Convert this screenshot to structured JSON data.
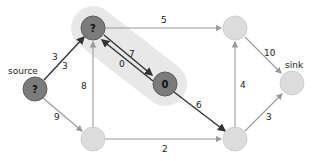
{
  "diagram": {
    "type": "flow-network",
    "colors": {
      "visited_node": "#7b7b7b",
      "unvisited_node": "#dcdcdc",
      "highlight_band": "#e6e6e6",
      "dark_edge": "#333333",
      "light_edge": "#9a9a9a"
    },
    "nodes": [
      {
        "id": "source",
        "label": "?",
        "caption": "source",
        "state": "visited"
      },
      {
        "id": "a",
        "label": "?",
        "state": "visited"
      },
      {
        "id": "b",
        "label": "0",
        "state": "visited"
      },
      {
        "id": "c",
        "label": "",
        "state": "unvisited"
      },
      {
        "id": "sink",
        "label": "",
        "caption": "sink",
        "state": "unvisited"
      },
      {
        "id": "d",
        "label": "",
        "state": "unvisited"
      },
      {
        "id": "e",
        "label": "",
        "state": "unvisited"
      }
    ],
    "edges": [
      {
        "from": "source",
        "to": "a",
        "labels": [
          "3",
          "3"
        ]
      },
      {
        "from": "a",
        "to": "c",
        "label": "5"
      },
      {
        "from": "a",
        "to": "b",
        "label": "7"
      },
      {
        "from": "b",
        "to": "a",
        "label": "0"
      },
      {
        "from": "c",
        "to": "sink",
        "label": "10"
      },
      {
        "from": "d",
        "to": "a",
        "label": "8"
      },
      {
        "from": "source",
        "to": "d",
        "label": "9"
      },
      {
        "from": "b",
        "to": "e",
        "label": "6"
      },
      {
        "from": "e",
        "to": "c",
        "label": "4"
      },
      {
        "from": "d",
        "to": "e",
        "label": "2"
      },
      {
        "from": "e",
        "to": "sink",
        "label": "3"
      }
    ]
  }
}
